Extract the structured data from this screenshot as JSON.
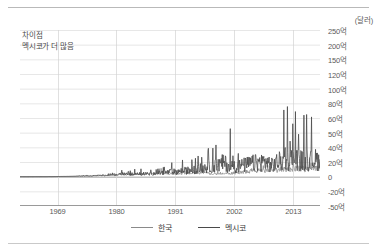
{
  "unit_label": "(달러)",
  "note": {
    "line1": "차이점",
    "line2": "멕시코가 더 많음"
  },
  "legend": {
    "items": [
      {
        "label": "한국",
        "color": "#8a8a8a"
      },
      {
        "label": "멕시코",
        "color": "#4a4a4a"
      }
    ]
  },
  "chart_data": {
    "type": "line",
    "title": "",
    "subtitle": "",
    "xlabel": "",
    "ylabel": "",
    "unit": "(달러)",
    "annotation": "차이점 / 멕시코가 더 많음",
    "grid": true,
    "legend_position": "bottom",
    "y_axis_note": "non-linear axis: evenly spaced gridlines with unequal value gaps",
    "y_ticks": [
      "250억",
      "200억",
      "150억",
      "120억",
      "100억",
      "80억",
      "60억",
      "50억",
      "40억",
      "20억",
      "0",
      "-20억",
      "-50억"
    ],
    "y_tick_values": [
      25000000000,
      20000000000,
      15000000000,
      12000000000,
      10000000000,
      8000000000,
      6000000000,
      5000000000,
      4000000000,
      2000000000,
      0,
      -2000000000,
      -5000000000
    ],
    "x_ticks": [
      "1969",
      "1980",
      "1991",
      "2002",
      "2013"
    ],
    "x_tick_values": [
      1969,
      1980,
      1991,
      2002,
      2013
    ],
    "xlim": [
      1962,
      2018
    ],
    "series": [
      {
        "name": "한국",
        "color": "#8a8a8a",
        "x": [
          1962,
          1963,
          1964,
          1965,
          1966,
          1967,
          1968,
          1969,
          1970,
          1971,
          1972,
          1973,
          1974,
          1975,
          1976,
          1977,
          1978,
          1979,
          1980,
          1981,
          1982,
          1983,
          1984,
          1985,
          1986,
          1987,
          1988,
          1989,
          1990,
          1991,
          1992,
          1993,
          1994,
          1995,
          1996,
          1997,
          1998,
          1999,
          2000,
          2001,
          2002,
          2003,
          2004,
          2005,
          2006,
          2007,
          2008,
          2009,
          2010,
          2011,
          2012,
          2013,
          2014,
          2015,
          2016,
          2017,
          2018
        ],
        "values": [
          0.05,
          0.05,
          0.06,
          0.08,
          0.1,
          0.12,
          0.15,
          0.2,
          0.25,
          0.3,
          0.4,
          0.6,
          0.7,
          0.8,
          1.1,
          1.4,
          1.8,
          2.0,
          2.2,
          2.6,
          2.8,
          3.2,
          3.6,
          3.4,
          3.8,
          4.4,
          4.8,
          4.6,
          4.4,
          4.2,
          4.0,
          4.4,
          4.8,
          5.6,
          5.2,
          5.0,
          3.0,
          4.0,
          5.0,
          4.4,
          4.8,
          5.6,
          6.6,
          7.0,
          7.6,
          8.0,
          8.4,
          6.6,
          8.6,
          9.6,
          9.8,
          10.2,
          11.0,
          10.0,
          9.8,
          11.0,
          10.6
        ]
      },
      {
        "name": "멕시코",
        "color": "#4a4a4a",
        "x": [
          1962,
          1963,
          1964,
          1965,
          1966,
          1967,
          1968,
          1969,
          1970,
          1971,
          1972,
          1973,
          1974,
          1975,
          1976,
          1977,
          1978,
          1979,
          1980,
          1981,
          1982,
          1983,
          1984,
          1985,
          1986,
          1987,
          1988,
          1989,
          1990,
          1991,
          1992,
          1993,
          1994,
          1995,
          1996,
          1997,
          1998,
          1999,
          2000,
          2001,
          2002,
          2003,
          2004,
          2005,
          2006,
          2007,
          2008,
          2009,
          2010,
          2011,
          2012,
          2013,
          2014,
          2015,
          2016,
          2017,
          2018
        ],
        "values": [
          0.06,
          0.06,
          0.07,
          0.09,
          0.11,
          0.13,
          0.16,
          0.22,
          0.28,
          0.34,
          0.45,
          0.7,
          0.9,
          1.0,
          1.3,
          1.6,
          2.0,
          2.4,
          2.8,
          3.4,
          3.0,
          2.6,
          3.4,
          3.8,
          3.6,
          4.2,
          4.8,
          5.4,
          6.0,
          6.4,
          7.0,
          7.6,
          8.6,
          9.4,
          11.0,
          12.6,
          13.4,
          14.6,
          18.0,
          14.0,
          13.0,
          13.6,
          15.0,
          16.6,
          17.4,
          18.4,
          19.0,
          14.6,
          18.6,
          20.4,
          19.6,
          24.0,
          21.0,
          20.0,
          19.6,
          22.0,
          20.0
        ]
      }
    ],
    "peak_annotation": {
      "series": "멕시코",
      "approx_year": 2013,
      "approx_value": "200억"
    }
  }
}
